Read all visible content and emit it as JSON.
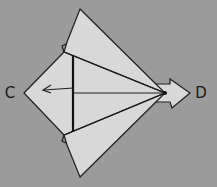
{
  "diagram": {
    "type": "origami-fold-step",
    "labels": {
      "left_point": "C",
      "right_point": "D"
    },
    "colors": {
      "background": "#9b9b9b",
      "paper": "#d8d8d8",
      "line": "#1e1e1e"
    },
    "icons": {
      "fold_arrow": "fold-left-arrow",
      "push_arrow": "hollow-right-arrow"
    }
  }
}
